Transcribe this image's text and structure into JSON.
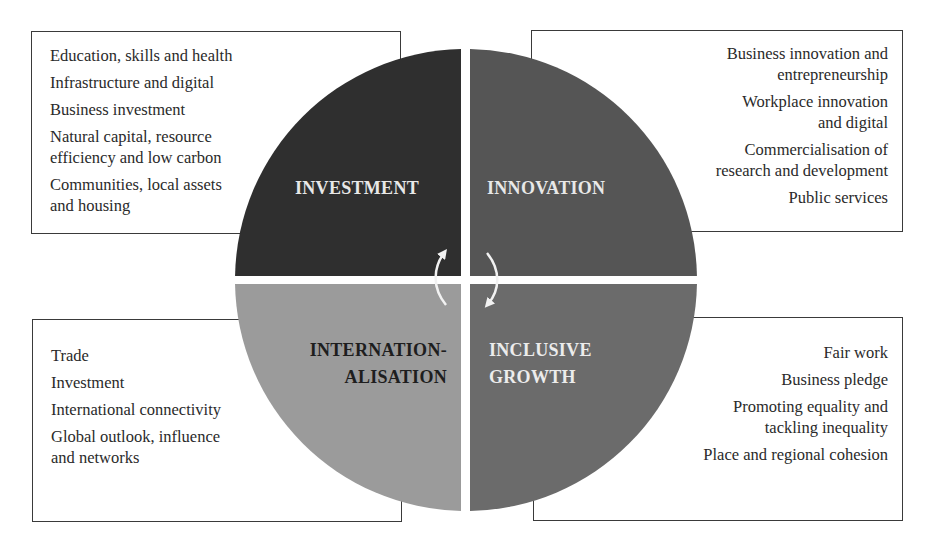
{
  "diagram": {
    "type": "four-quadrant-circle",
    "center_gap_color": "#ffffff",
    "arrows": "circular arrows at center indicating cycle between quadrants"
  },
  "quadrants": {
    "investment": {
      "label": "INVESTMENT",
      "color": "#2f2f2f",
      "label_color": "#e8e8e8",
      "items": [
        "Education, skills and health",
        "Infrastructure and digital",
        "Business investment",
        "Natural capital, resource\nefficiency and low carbon",
        "Communities, local assets\nand housing"
      ]
    },
    "innovation": {
      "label": "INNOVATION",
      "color": "#555555",
      "label_color": "#e8e8e8",
      "items": [
        "Business innovation and\nentrepreneurship",
        "Workplace innovation\nand digital",
        "Commercialisation of\nresearch and development",
        "Public services"
      ]
    },
    "internationalisation": {
      "label": "INTERNATION-\nALISATION",
      "color": "#9b9b9b",
      "label_color": "#1e1e1e",
      "items": [
        "Trade",
        "Investment",
        "International connectivity",
        "Global outlook, influence\nand networks"
      ]
    },
    "inclusive_growth": {
      "label": "INCLUSIVE\nGROWTH",
      "color": "#6b6b6b",
      "label_color": "#ececec",
      "items": [
        "Fair work",
        "Business pledge",
        "Promoting equality and\ntackling inequality",
        "Place and regional cohesion"
      ]
    }
  }
}
